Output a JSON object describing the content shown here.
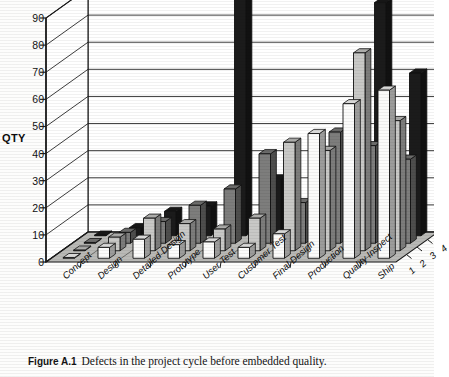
{
  "figure": {
    "caption_number": "Figure A.1",
    "caption_text": "Defects in the project cycle before embedded quality."
  },
  "chart_data": {
    "type": "bar",
    "subtype": "3d-clustered-column",
    "title": "",
    "xlabel": "",
    "ylabel": "QTY",
    "zlabel": "",
    "ylim": [
      0,
      90
    ],
    "ytick_step": 10,
    "yticks": [
      0,
      10,
      20,
      30,
      40,
      50,
      60,
      70,
      80,
      90
    ],
    "grid": true,
    "legend": "none",
    "categories": [
      "Concept",
      "Design",
      "Detailed Design",
      "Prototype",
      "User Test",
      "Customer Test",
      "Final Design",
      "Production",
      "Quality Inspect",
      "Ship"
    ],
    "depth_categories": [
      "1",
      "2",
      "3",
      "4"
    ],
    "series": [
      {
        "name": "1",
        "color": "#fbfbfa",
        "values": [
          0,
          4,
          7,
          5,
          6,
          4,
          9,
          46,
          57,
          62
        ]
      },
      {
        "name": "2",
        "color": "#c8c8c6",
        "values": [
          0,
          5,
          12,
          10,
          8,
          12,
          40,
          37,
          73,
          48
        ]
      },
      {
        "name": "3",
        "color": "#7d7d7c",
        "values": [
          0,
          4,
          8,
          14,
          20,
          33,
          15,
          41,
          36,
          31
        ]
      },
      {
        "name": "4",
        "color": "#1b1b1b",
        "values": [
          0,
          3,
          9,
          11,
          90,
          21,
          8,
          30,
          86,
          60
        ]
      }
    ]
  }
}
